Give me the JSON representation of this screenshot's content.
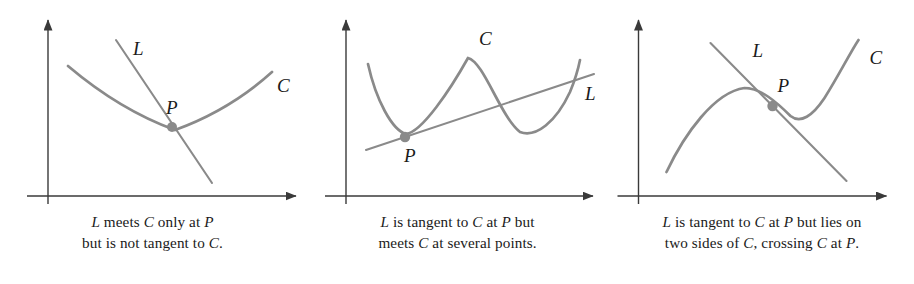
{
  "figure": {
    "curve_color": "#8a8a8a",
    "axis_color": "#3a3a3a",
    "point_color": "#8a8a8a",
    "label_color": "#1a1a1a",
    "background": "#ffffff"
  },
  "panels": [
    {
      "id": "panel-1",
      "curve_label": "C",
      "line_label": "L",
      "point_label": "P",
      "caption_lines": [
        {
          "parts": [
            {
              "text": "L",
              "italic": true
            },
            {
              "text": " meets ",
              "italic": false
            },
            {
              "text": "C",
              "italic": true
            },
            {
              "text": " only at ",
              "italic": false
            },
            {
              "text": "P",
              "italic": true
            }
          ]
        },
        {
          "parts": [
            {
              "text": "but is not tangent to ",
              "italic": false
            },
            {
              "text": "C",
              "italic": true
            },
            {
              "text": ".",
              "italic": false
            }
          ]
        }
      ],
      "caption_text": "L meets C only at P but is not tangent to C."
    },
    {
      "id": "panel-2",
      "curve_label": "C",
      "line_label": "L",
      "point_label": "P",
      "caption_lines": [
        {
          "parts": [
            {
              "text": "L",
              "italic": true
            },
            {
              "text": " is tangent to ",
              "italic": false
            },
            {
              "text": "C",
              "italic": true
            },
            {
              "text": " at ",
              "italic": false
            },
            {
              "text": "P",
              "italic": true
            },
            {
              "text": " but",
              "italic": false
            }
          ]
        },
        {
          "parts": [
            {
              "text": "meets ",
              "italic": false
            },
            {
              "text": "C",
              "italic": true
            },
            {
              "text": " at several points.",
              "italic": false
            }
          ]
        }
      ],
      "caption_text": "L is tangent to C at P but meets C at several points."
    },
    {
      "id": "panel-3",
      "curve_label": "C",
      "line_label": "L",
      "point_label": "P",
      "caption_lines": [
        {
          "parts": [
            {
              "text": "L",
              "italic": true
            },
            {
              "text": " is tangent to ",
              "italic": false
            },
            {
              "text": "C",
              "italic": true
            },
            {
              "text": " at ",
              "italic": false
            },
            {
              "text": "P",
              "italic": true
            },
            {
              "text": " but lies on",
              "italic": false
            }
          ]
        },
        {
          "parts": [
            {
              "text": "two sides of ",
              "italic": false
            },
            {
              "text": "C",
              "italic": true
            },
            {
              "text": ", crossing ",
              "italic": false
            },
            {
              "text": "C",
              "italic": true
            },
            {
              "text": " at ",
              "italic": false
            },
            {
              "text": "P",
              "italic": true
            },
            {
              "text": ".",
              "italic": false
            }
          ]
        }
      ],
      "caption_text": "L is tangent to C at P but lies on two sides of C, crossing C at P."
    }
  ],
  "chart_data": {
    "type": "line",
    "panels": [
      {
        "name": "L meets C only at P but is not tangent to C",
        "axes": {
          "y_axis_x": 48,
          "x_axis_y": 196,
          "x_axis_from": 27,
          "x_axis_to": 300,
          "y_axis_from": 204,
          "y_axis_to": 16
        },
        "curve": {
          "label": "C",
          "type": "parabola-upward",
          "points": [
            [
              68,
              66
            ],
            [
              95,
              94
            ],
            [
              122,
              114
            ],
            [
              150,
              126
            ],
            [
              175,
              130
            ],
            [
              200,
              126
            ],
            [
              228,
              114
            ],
            [
              252,
              96
            ],
            [
              272,
              72
            ]
          ],
          "label_pos": [
            280,
            84
          ]
        },
        "line": {
          "label": "L",
          "type": "secant-steep-negative",
          "endpoints": [
            [
              116,
              40
            ],
            [
              212,
              183
            ]
          ],
          "label_pos": [
            133,
            48
          ]
        },
        "point": {
          "label": "P",
          "coords": [
            172,
            127
          ],
          "label_pos": [
            172,
            108
          ],
          "radius": 5
        }
      },
      {
        "name": "L is tangent to C at P but meets C at several points",
        "axes": {
          "y_axis_x": 346,
          "x_axis_y": 196,
          "x_axis_from": 325,
          "x_axis_to": 597,
          "y_axis_from": 204,
          "y_axis_to": 16
        },
        "curve": {
          "label": "C",
          "type": "quartic-wave",
          "points": [
            [
              368,
              64
            ],
            [
              378,
              92
            ],
            [
              390,
              118
            ],
            [
              400,
              132
            ],
            [
              410,
              134
            ],
            [
              425,
              114
            ],
            [
              440,
              86
            ],
            [
              455,
              66
            ],
            [
              468,
              58
            ],
            [
              480,
              64
            ],
            [
              492,
              86
            ],
            [
              506,
              114
            ],
            [
              520,
              132
            ],
            [
              534,
              136
            ],
            [
              548,
              128
            ],
            [
              562,
              106
            ],
            [
              572,
              84
            ],
            [
              580,
              62
            ]
          ],
          "label_pos": [
            483,
            40
          ]
        },
        "line": {
          "label": "L",
          "type": "tangent-positive-slope",
          "endpoints": [
            [
              366,
              150
            ],
            [
              590,
              76
            ]
          ],
          "label_pos": [
            588,
            95
          ]
        },
        "point": {
          "label": "P",
          "coords": [
            405,
            136
          ],
          "label_pos": [
            410,
            156
          ],
          "radius": 5
        }
      },
      {
        "name": "L is tangent to C at P but lies on two sides of C, crossing C at P",
        "axes": {
          "y_axis_x": 638,
          "x_axis_y": 196,
          "x_axis_from": 617,
          "x_axis_to": 890,
          "y_axis_from": 204,
          "y_axis_to": 16
        },
        "curve": {
          "label": "C",
          "type": "cubic-increasing",
          "points": [
            [
              666,
              172
            ],
            [
              680,
              150
            ],
            [
              694,
              128
            ],
            [
              708,
              110
            ],
            [
              722,
              96
            ],
            [
              736,
              89
            ],
            [
              750,
              88
            ],
            [
              764,
              95
            ],
            [
              778,
              106
            ],
            [
              790,
              115
            ],
            [
              802,
              119
            ],
            [
              814,
              114
            ],
            [
              826,
              100
            ],
            [
              838,
              80
            ],
            [
              850,
              58
            ],
            [
              858,
              42
            ]
          ],
          "label_pos": [
            872,
            57
          ]
        },
        "line": {
          "label": "L",
          "type": "tangent-negative-slope",
          "endpoints": [
            [
              712,
              45
            ],
            [
              845,
              180
            ]
          ],
          "label_pos": [
            756,
            50
          ]
        },
        "point": {
          "label": "P",
          "coords": [
            772,
            107
          ],
          "label_pos": [
            780,
            86
          ],
          "radius": 5
        }
      }
    ]
  }
}
